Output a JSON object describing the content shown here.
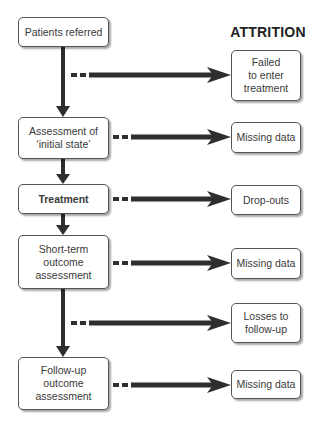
{
  "title": "ATTRITION",
  "flow": [
    {
      "id": "patients-referred",
      "label": "Patients referred",
      "bold": false
    },
    {
      "id": "assessment-initial-state",
      "label": "Assessment of\n‘initial state’",
      "bold": false
    },
    {
      "id": "treatment",
      "label": "Treatment",
      "bold": true
    },
    {
      "id": "short-term-outcome",
      "label": "Short-term\noutcome\nassessment",
      "bold": false
    },
    {
      "id": "follow-up-outcome",
      "label": "Follow-up\noutcome\nassessment",
      "bold": false
    }
  ],
  "attrition": [
    {
      "id": "failed-to-enter",
      "label": "Failed\nto enter\ntreatment"
    },
    {
      "id": "missing-data-1",
      "label": "Missing data"
    },
    {
      "id": "drop-outs",
      "label": "Drop-outs"
    },
    {
      "id": "missing-data-2",
      "label": "Missing data"
    },
    {
      "id": "losses-to-follow-up",
      "label": "Losses to\nfollow-up"
    },
    {
      "id": "missing-data-3",
      "label": "Missing data"
    }
  ],
  "colors": {
    "arrow": "#2e2e2e",
    "border": "#555555",
    "text": "#3a3a3a"
  }
}
